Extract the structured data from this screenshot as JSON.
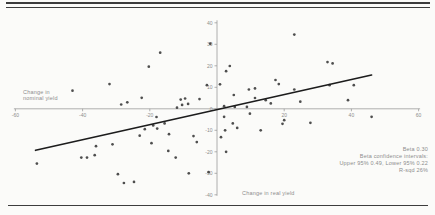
{
  "chart_data": {
    "type": "scatter",
    "title": "",
    "xlabel": "Change in real yield",
    "ylabel": "Change in nominal yield",
    "xlim": [
      -60,
      60
    ],
    "ylim": [
      -40,
      40
    ],
    "x_ticks": [
      -60,
      -40,
      -20,
      20,
      40,
      60
    ],
    "y_ticks": [
      40,
      30,
      20,
      10,
      0,
      -10,
      -20,
      -30,
      -40
    ],
    "grid": false,
    "legend": "none",
    "marker": "dot",
    "annotations": [
      "Beta 0.30",
      "Beta confidence intervals:",
      "Upper 95% 0.49, Lower 95% 0.22",
      "R-sqd 26%"
    ],
    "trendline": {
      "type": "linear",
      "x1": -54,
      "y1": -19.3,
      "x2": 46,
      "y2": 15.7
    },
    "points": [
      [
        -43,
        8.4
      ],
      [
        -32,
        11.5
      ],
      [
        -28.5,
        2
      ],
      [
        -26.7,
        3
      ],
      [
        -22.4,
        5.1
      ],
      [
        -20.3,
        19.6
      ],
      [
        -16.9,
        26.1
      ],
      [
        -11.9,
        0.5
      ],
      [
        -10.8,
        4.3
      ],
      [
        -10.4,
        1.8
      ],
      [
        -9.5,
        4.8
      ],
      [
        -8.6,
        2.3
      ],
      [
        -5.2,
        4.5
      ],
      [
        -3,
        11
      ],
      [
        -2,
        30.3
      ],
      [
        0.9,
        11.4
      ],
      [
        2.1,
        1.2
      ],
      [
        2.7,
        17.5
      ],
      [
        3.8,
        19.9
      ],
      [
        5,
        6.4
      ],
      [
        5.3,
        0.9
      ],
      [
        8.9,
        0.9
      ],
      [
        9.5,
        9
      ],
      [
        11.3,
        9.5
      ],
      [
        11.3,
        5
      ],
      [
        14.5,
        4
      ],
      [
        16,
        2.5
      ],
      [
        17.4,
        13.4
      ],
      [
        18.4,
        11.5
      ],
      [
        23,
        34.5
      ],
      [
        23,
        9
      ],
      [
        24.8,
        3.3
      ],
      [
        32.9,
        21.7
      ],
      [
        34.4,
        21.1
      ],
      [
        33.5,
        11
      ],
      [
        39,
        4
      ],
      [
        40.7,
        11
      ],
      [
        -53.6,
        -25.5
      ],
      [
        -40.4,
        -22.7
      ],
      [
        -38.7,
        -22.7
      ],
      [
        -36.4,
        -21.6
      ],
      [
        -36,
        -17.4
      ],
      [
        -31.1,
        -16.5
      ],
      [
        -29.5,
        -30.4
      ],
      [
        -27.7,
        -34.5
      ],
      [
        -24.7,
        -34
      ],
      [
        -23,
        -12.5
      ],
      [
        -21.5,
        -9.5
      ],
      [
        -19.5,
        -16
      ],
      [
        -19,
        -7.7
      ],
      [
        -18,
        -3.8
      ],
      [
        -17.8,
        -9.2
      ],
      [
        -15.6,
        -6.8
      ],
      [
        -14.5,
        -19.6
      ],
      [
        -14.3,
        -11.8
      ],
      [
        -12.3,
        -22.7
      ],
      [
        -8.4,
        -30
      ],
      [
        -7,
        -12.7
      ],
      [
        -6,
        -15.5
      ],
      [
        -2.5,
        -29.5
      ],
      [
        1.2,
        -13.2
      ],
      [
        2.1,
        -3.7
      ],
      [
        2.4,
        -10
      ],
      [
        2.7,
        -20
      ],
      [
        4.7,
        -6.8
      ],
      [
        6,
        -8.9
      ],
      [
        9.8,
        -2.3
      ],
      [
        13,
        -10
      ],
      [
        20,
        -5.3
      ],
      [
        19.5,
        -7
      ],
      [
        27.8,
        -6.5
      ],
      [
        46,
        -3.7
      ]
    ]
  },
  "colors": {
    "background": "#fbfbf9",
    "rule": "#3d3d3d",
    "axis": "#9c9c9c",
    "tick_text": "#8d8d8d",
    "dot": "#3f3f3f",
    "trend": "#1c1c1c"
  }
}
